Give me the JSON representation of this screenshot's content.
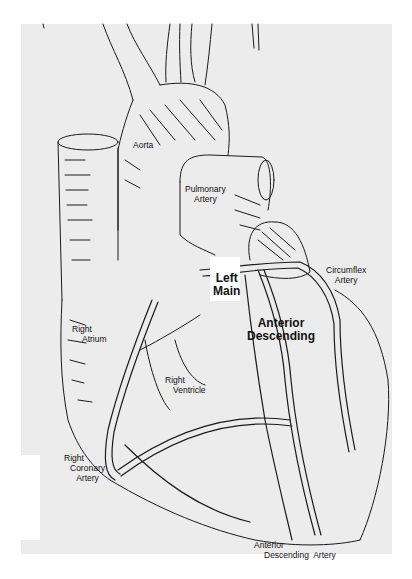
{
  "figure": {
    "colors": {
      "paper": "#ececec",
      "ink": "#111111",
      "background": "#ffffff"
    }
  },
  "labels": {
    "aorta": "Aorta",
    "pulmonary_artery": [
      "Pulmonary",
      "Artery"
    ],
    "left_main": [
      "Left",
      "Main"
    ],
    "circumflex_artery": [
      "Circumflex",
      "Artery"
    ],
    "anterior_descending": [
      "Anterior",
      "Descending"
    ],
    "right_atrium": [
      "Right",
      "Atrium"
    ],
    "right_ventricle": [
      "Right",
      "Ventricle"
    ],
    "right_coronary_artery": [
      "Right",
      "Coronary",
      "Artery"
    ],
    "anterior_descending_artery": [
      "Anterior",
      "Descending  Artery"
    ]
  }
}
